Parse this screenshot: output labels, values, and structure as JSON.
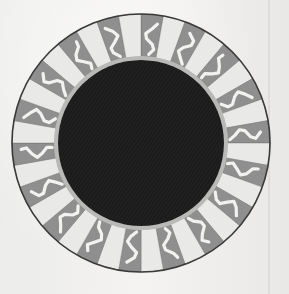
{
  "artwork": {
    "subject": "eclipsed sun engraving",
    "center": [
      141,
      143
    ],
    "outer_radius": 129,
    "inner_ring_radius": 86,
    "disk_radius": 83,
    "ray_count": 36,
    "colors": {
      "paper": "#f1f0ee",
      "disk": "#1b1b1b",
      "ray_dark": "#8f8f8f",
      "ray_light": "#e9e9e7",
      "flame": "#f2f2f0",
      "outline": "#3a3a3a",
      "rim": "#b9b9b7"
    }
  }
}
